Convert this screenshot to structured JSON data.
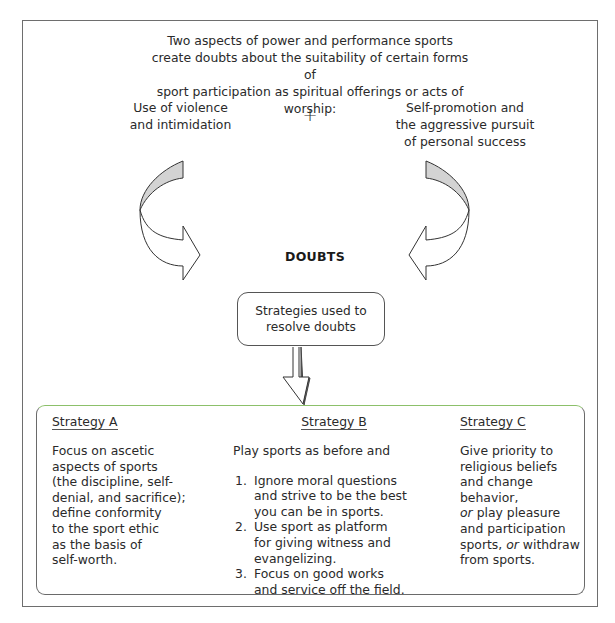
{
  "intro": {
    "lines": [
      "Two aspects of power and performance sports",
      "create doubts about the suitability of certain forms of",
      "sport participation as spiritual offerings or acts of worship:"
    ]
  },
  "aspects": {
    "left": [
      "Use of violence",
      "and intimidation"
    ],
    "plus": "+",
    "right": [
      "Self-promotion and",
      "the aggressive pursuit",
      "of personal success"
    ]
  },
  "center_label": "DOUBTS",
  "resolve_box": [
    "Strategies used to",
    "resolve doubts"
  ],
  "strategies": {
    "a": {
      "title": "Strategy A",
      "lines": [
        "Focus on ascetic",
        "aspects of sports",
        "(the discipline, self-",
        "denial, and sacrifice);",
        "define conformity",
        "to the sport ethic",
        "as the basis of",
        "self-worth."
      ]
    },
    "b": {
      "title": "Strategy B",
      "intro": "Play sports as before and",
      "items": [
        {
          "num": "1.",
          "lines": [
            "Ignore moral questions",
            "and strive to be the best",
            "you can be in sports."
          ]
        },
        {
          "num": "2.",
          "lines": [
            "Use sport as platform",
            "for giving witness and",
            "evangelizing."
          ]
        },
        {
          "num": "3.",
          "lines": [
            "Focus on good works",
            "and service off the field."
          ]
        }
      ]
    },
    "c": {
      "title": "Strategy C",
      "lines": [
        "Give priority to",
        "religious beliefs",
        "and change behavior,",
        "or play pleasure",
        "and participation",
        "sports, or withdraw",
        "from sports."
      ],
      "italic_word": "or"
    }
  },
  "colors": {
    "frame": "#6e6e6e",
    "arrow_fill": "#d3d3d3",
    "strategy_box_top": "#8cc06a",
    "text": "#2a2a2a"
  }
}
